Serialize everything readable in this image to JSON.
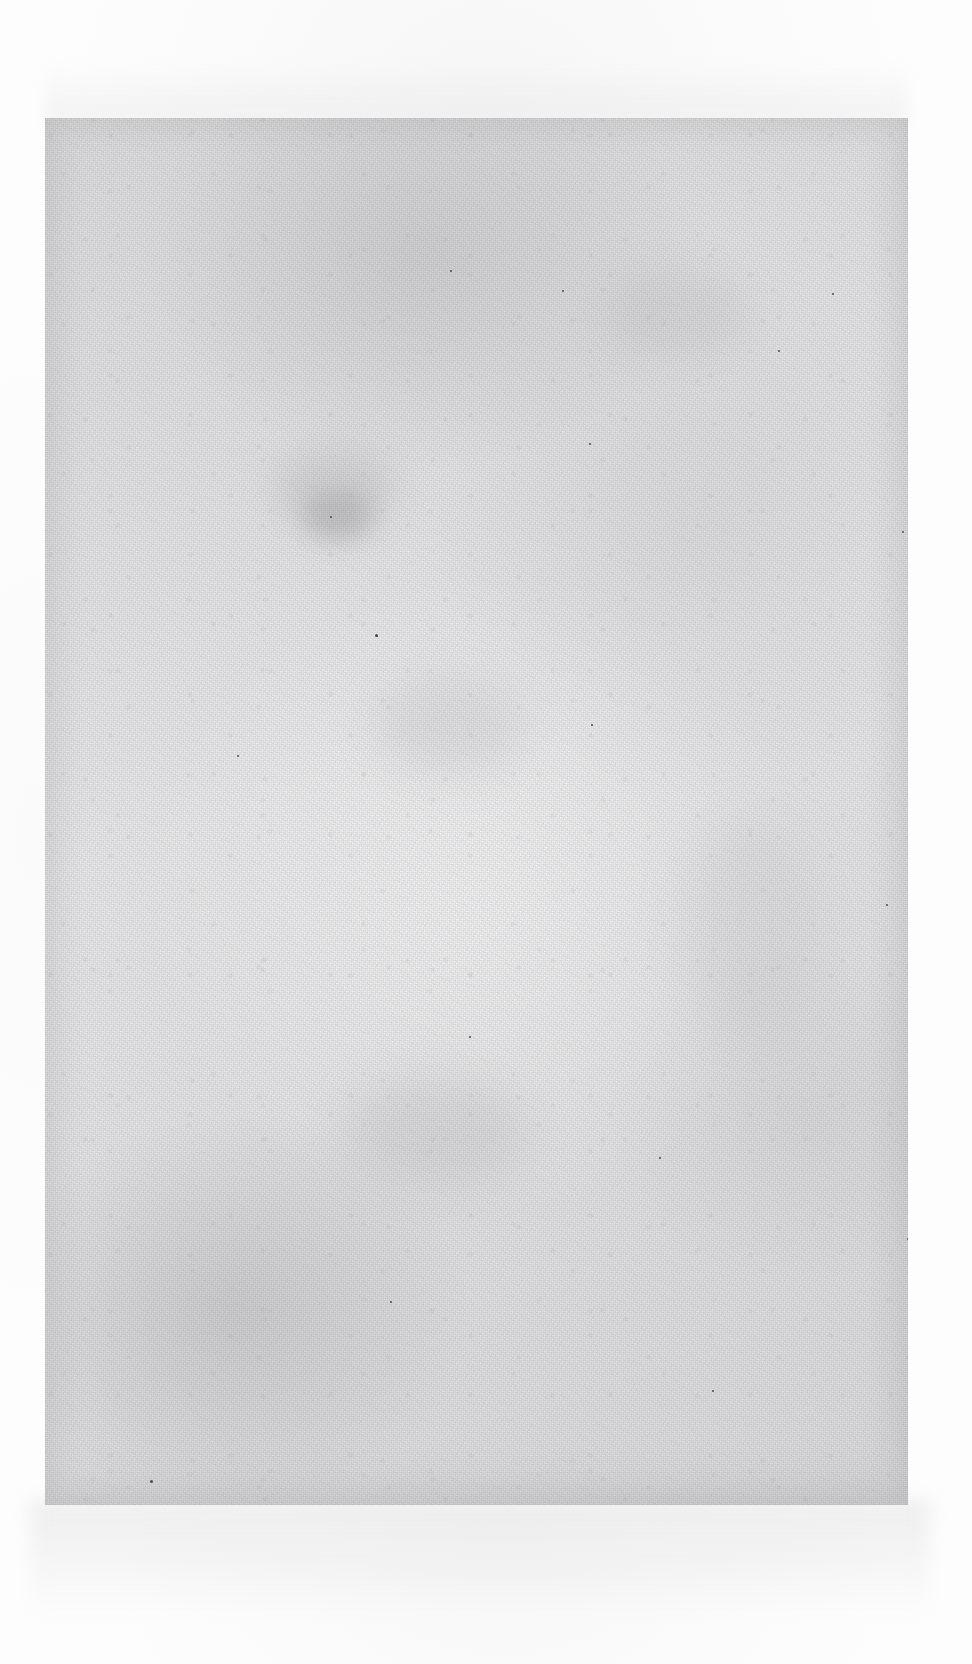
{
  "document": {
    "type": "scanned-page",
    "content_text": "",
    "page_background_color": "#ececed",
    "backdrop_color": "#fdfdfd",
    "speck_color": "#4a4a4e"
  },
  "page_region": {
    "left": 45,
    "top": 118,
    "width": 863,
    "height": 1387
  },
  "smudges": [
    {
      "name": "faint-stain-upper-left",
      "left": 230,
      "top": 330,
      "width": 120,
      "height": 80,
      "color": "rgba(155,155,160,0.22)",
      "blur": 16
    },
    {
      "name": "faint-stain-center-left",
      "left": 258,
      "top": 372,
      "width": 70,
      "height": 52,
      "color": "rgba(140,140,146,0.30)",
      "blur": 11
    },
    {
      "name": "faint-stain-mid-page",
      "left": 330,
      "top": 560,
      "width": 150,
      "height": 95,
      "color": "rgba(160,160,165,0.18)",
      "blur": 20
    },
    {
      "name": "faint-stain-lower-center",
      "left": 300,
      "top": 960,
      "width": 180,
      "height": 110,
      "color": "rgba(158,158,163,0.20)",
      "blur": 22
    },
    {
      "name": "faint-stain-upper-right",
      "left": 560,
      "top": 150,
      "width": 140,
      "height": 90,
      "color": "rgba(162,162,167,0.17)",
      "blur": 19
    },
    {
      "name": "faint-stain-right-band",
      "left": 640,
      "top": 700,
      "width": 130,
      "height": 220,
      "color": "rgba(164,164,169,0.14)",
      "blur": 24
    }
  ],
  "specks": [
    {
      "left": 330,
      "top": 516,
      "size": 3
    },
    {
      "left": 331,
      "top": 517,
      "size": 2
    },
    {
      "left": 285,
      "top": 398,
      "size": 2
    },
    {
      "left": 733,
      "top": 232,
      "size": 2
    },
    {
      "left": 787,
      "top": 175,
      "size": 2
    },
    {
      "left": 857,
      "top": 413,
      "size": 2
    },
    {
      "left": 405,
      "top": 152,
      "size": 2
    },
    {
      "left": 517,
      "top": 172,
      "size": 2
    },
    {
      "left": 544,
      "top": 325,
      "size": 2
    },
    {
      "left": 546,
      "top": 606,
      "size": 2
    },
    {
      "left": 192,
      "top": 637,
      "size": 2
    },
    {
      "left": 345,
      "top": 1183,
      "size": 2
    },
    {
      "left": 499,
      "top": 1397,
      "size": 2
    },
    {
      "left": 147,
      "top": 1388,
      "size": 2
    },
    {
      "left": 105,
      "top": 1362,
      "size": 3
    },
    {
      "left": 360,
      "top": 1483,
      "size": 2
    },
    {
      "left": 252,
      "top": 1484,
      "size": 2
    },
    {
      "left": 862,
      "top": 1120,
      "size": 2
    },
    {
      "left": 841,
      "top": 786,
      "size": 2
    },
    {
      "left": 868,
      "top": 882,
      "size": 2
    },
    {
      "left": 667,
      "top": 1272,
      "size": 2
    },
    {
      "left": 892,
      "top": 1315,
      "size": 2
    },
    {
      "left": 614,
      "top": 1039,
      "size": 2
    },
    {
      "left": 424,
      "top": 918,
      "size": 2
    }
  ]
}
